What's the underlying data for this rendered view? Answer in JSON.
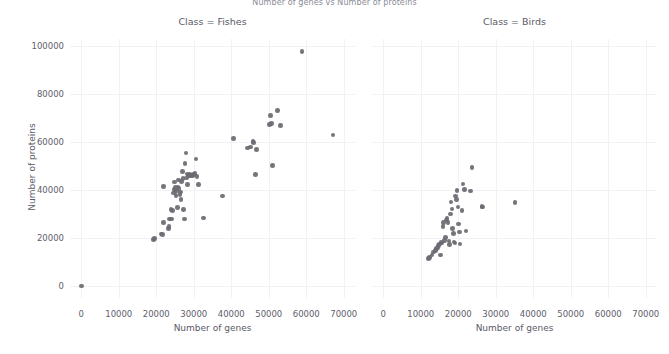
{
  "figure": {
    "title": "Number of genes vs Number of proteins",
    "xaxis_title": "Number of genes",
    "yaxis_title": "Number of proteins",
    "panel_fishes_title": "Class = Fishes",
    "panel_birds_title": "Class = Birds",
    "dot_color": "#6b6b72",
    "grid_color": "#f2f2f4",
    "background_color": "#ffffff",
    "xticks": [
      "0",
      "10000",
      "20000",
      "30000",
      "40000",
      "50000",
      "60000",
      "70000"
    ],
    "yticks": [
      "0",
      "20000",
      "40000",
      "60000",
      "80000",
      "100000"
    ]
  },
  "chart_data": {
    "type": "scatter",
    "title": "Number of genes vs Number of proteins",
    "xlabel": "Number of genes",
    "ylabel": "Number of proteins",
    "xlim": [
      -3000,
      73000
    ],
    "ylim": [
      -5000,
      103000
    ],
    "xticks": [
      0,
      10000,
      20000,
      30000,
      40000,
      50000,
      60000,
      70000
    ],
    "yticks": [
      0,
      20000,
      40000,
      60000,
      80000,
      100000
    ],
    "grid": true,
    "legend": "none",
    "facet_variable": "Class",
    "panels": [
      {
        "name": "Class = Fishes",
        "points": [
          [
            0,
            0
          ],
          [
            19300,
            19400
          ],
          [
            19600,
            19700
          ],
          [
            21300,
            21700
          ],
          [
            21600,
            21400
          ],
          [
            21900,
            41600
          ],
          [
            22000,
            26400
          ],
          [
            23200,
            23900
          ],
          [
            23400,
            24700
          ],
          [
            23600,
            27900
          ],
          [
            23900,
            31900
          ],
          [
            24100,
            28000
          ],
          [
            24300,
            31500
          ],
          [
            24600,
            38800
          ],
          [
            24800,
            40200
          ],
          [
            24900,
            43400
          ],
          [
            25100,
            41000
          ],
          [
            25300,
            37800
          ],
          [
            25400,
            39600
          ],
          [
            25600,
            32800
          ],
          [
            25800,
            41300
          ],
          [
            26000,
            44200
          ],
          [
            26100,
            40600
          ],
          [
            26300,
            38200
          ],
          [
            26500,
            39200
          ],
          [
            26600,
            36000
          ],
          [
            26800,
            43500
          ],
          [
            27000,
            47700
          ],
          [
            27100,
            44800
          ],
          [
            27300,
            31800
          ],
          [
            27500,
            28000
          ],
          [
            27700,
            51200
          ],
          [
            27900,
            55400
          ],
          [
            28000,
            45100
          ],
          [
            28200,
            46700
          ],
          [
            28400,
            42400
          ],
          [
            28600,
            46200
          ],
          [
            28800,
            46600
          ],
          [
            29100,
            45800
          ],
          [
            29400,
            46300
          ],
          [
            29700,
            45900
          ],
          [
            30000,
            46400
          ],
          [
            30300,
            47000
          ],
          [
            30600,
            52900
          ],
          [
            30900,
            45600
          ],
          [
            31200,
            42300
          ],
          [
            32600,
            28400
          ],
          [
            37600,
            37500
          ],
          [
            40600,
            61400
          ],
          [
            44400,
            57500
          ],
          [
            45200,
            58000
          ],
          [
            45800,
            60300
          ],
          [
            46000,
            59900
          ],
          [
            46400,
            46400
          ],
          [
            46700,
            57000
          ],
          [
            50200,
            67300
          ],
          [
            50400,
            71100
          ],
          [
            50700,
            67700
          ],
          [
            51000,
            50300
          ],
          [
            52300,
            73200
          ],
          [
            53200,
            67000
          ],
          [
            58900,
            97700
          ],
          [
            67100,
            63000
          ]
        ]
      },
      {
        "name": "Class = Birds",
        "points": [
          [
            12100,
            11500
          ],
          [
            12400,
            11900
          ],
          [
            13000,
            12900
          ],
          [
            13400,
            14200
          ],
          [
            13900,
            14700
          ],
          [
            14200,
            15700
          ],
          [
            14600,
            16100
          ],
          [
            14800,
            16800
          ],
          [
            15000,
            17600
          ],
          [
            15200,
            13000
          ],
          [
            15400,
            18200
          ],
          [
            15700,
            17900
          ],
          [
            15900,
            24900
          ],
          [
            16100,
            26600
          ],
          [
            16300,
            19100
          ],
          [
            16600,
            20300
          ],
          [
            16800,
            27500
          ],
          [
            17000,
            28300
          ],
          [
            17300,
            26500
          ],
          [
            17500,
            18700
          ],
          [
            17700,
            17200
          ],
          [
            17900,
            30100
          ],
          [
            18100,
            35100
          ],
          [
            18300,
            32100
          ],
          [
            18500,
            24100
          ],
          [
            18700,
            21900
          ],
          [
            18900,
            18300
          ],
          [
            19100,
            17900
          ],
          [
            19300,
            37600
          ],
          [
            19500,
            36100
          ],
          [
            19700,
            39900
          ],
          [
            19900,
            33000
          ],
          [
            20100,
            25800
          ],
          [
            20300,
            22600
          ],
          [
            20500,
            17500
          ],
          [
            21000,
            31600
          ],
          [
            21300,
            42500
          ],
          [
            21700,
            40300
          ],
          [
            22100,
            23000
          ],
          [
            23300,
            39600
          ],
          [
            23700,
            49400
          ],
          [
            26300,
            33100
          ],
          [
            26500,
            32900
          ],
          [
            35100,
            34800
          ]
        ]
      }
    ]
  }
}
